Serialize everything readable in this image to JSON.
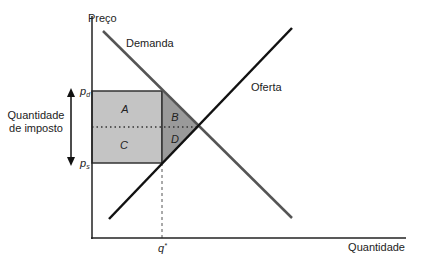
{
  "diagram": {
    "axes": {
      "y_label": "Preço",
      "x_label": "Quantidade"
    },
    "curves": {
      "demand_label": "Demanda",
      "supply_label": "Oferta"
    },
    "price_labels": {
      "pd": "p",
      "pd_sub": "d",
      "ps": "p",
      "ps_sub": "s"
    },
    "quantity_label": {
      "q": "q",
      "q_sup": "*"
    },
    "tax_label": {
      "line1": "Quantidade",
      "line2": "de imposto"
    },
    "regions": {
      "a": "A",
      "b": "B",
      "c": "C",
      "d": "D"
    },
    "colors": {
      "axis": "#222222",
      "demand": "#555555",
      "supply": "#111111",
      "tax_rect": "#c4c4c4",
      "deadweight": "#9a9a9a"
    }
  }
}
